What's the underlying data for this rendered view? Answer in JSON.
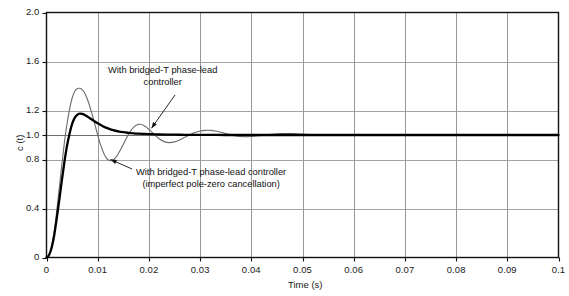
{
  "chart_data": {
    "type": "line",
    "title": "",
    "xlabel": "Time (s)",
    "ylabel": "c (t)",
    "xlim": [
      0,
      0.1
    ],
    "ylim": [
      0,
      2.0
    ],
    "grid": true,
    "legend": "none",
    "xticks": [
      "0",
      "0.01",
      "0.02",
      "0.03",
      "0.04",
      "0.05",
      "0.06",
      "0.07",
      "0.08",
      "0.09",
      "0.1"
    ],
    "xtick_values": [
      0,
      0.01,
      0.02,
      0.03,
      0.04,
      0.05,
      0.06,
      0.07,
      0.08,
      0.09,
      0.1
    ],
    "yticks": [
      "0",
      "0.4",
      "0.8",
      "1.0",
      "1.2",
      "1.6",
      "2.0"
    ],
    "ytick_values": [
      0,
      0.4,
      0.8,
      1.0,
      1.2,
      1.6,
      2.0
    ],
    "annotations": [
      {
        "name": "annotation-phase-lead",
        "lines": [
          "With bridged-T phase-lead",
          "controller"
        ],
        "target_point": [
          0.0205,
          1.055
        ]
      },
      {
        "name": "annotation-imperfect-cancellation",
        "lines": [
          "With bridged-T phase-lead controller",
          "(imperfect pole-zero cancellation)"
        ],
        "target_point": [
          0.0125,
          0.8
        ]
      }
    ],
    "series": [
      {
        "name": "With bridged-T phase-lead controller",
        "color": "#000000",
        "width": 2.3,
        "x": [
          0,
          0.0005,
          0.001,
          0.0015,
          0.002,
          0.0025,
          0.003,
          0.0035,
          0.004,
          0.0045,
          0.005,
          0.0055,
          0.006,
          0.0065,
          0.007,
          0.0075,
          0.008,
          0.009,
          0.01,
          0.011,
          0.012,
          0.013,
          0.014,
          0.015,
          0.016,
          0.017,
          0.018,
          0.019,
          0.02,
          0.022,
          0.024,
          0.026,
          0.028,
          0.03,
          0.035,
          0.04,
          0.05,
          0.06,
          0.07,
          0.08,
          0.09,
          0.1
        ],
        "y": [
          0,
          0.02,
          0.08,
          0.18,
          0.32,
          0.47,
          0.63,
          0.78,
          0.91,
          1.01,
          1.09,
          1.14,
          1.165,
          1.175,
          1.172,
          1.163,
          1.15,
          1.122,
          1.095,
          1.072,
          1.054,
          1.04,
          1.03,
          1.023,
          1.018,
          1.014,
          1.011,
          1.009,
          1.007,
          1.004,
          1.003,
          1.002,
          1.001,
          1.001,
          1.0,
          1.0,
          1.0,
          1.0,
          1.0,
          1.0,
          1.0,
          1.0
        ]
      },
      {
        "name": "With bridged-T phase-lead controller (imperfect pole-zero cancellation)",
        "color": "#6b6b6b",
        "width": 1.1,
        "x": [
          0,
          0.0005,
          0.001,
          0.0015,
          0.002,
          0.0025,
          0.003,
          0.0035,
          0.004,
          0.0045,
          0.005,
          0.0055,
          0.006,
          0.0065,
          0.007,
          0.0075,
          0.008,
          0.0085,
          0.009,
          0.0095,
          0.01,
          0.0105,
          0.011,
          0.0115,
          0.012,
          0.0125,
          0.013,
          0.0135,
          0.014,
          0.0145,
          0.015,
          0.0155,
          0.016,
          0.0165,
          0.017,
          0.0175,
          0.018,
          0.0185,
          0.019,
          0.0195,
          0.02,
          0.021,
          0.022,
          0.023,
          0.024,
          0.025,
          0.026,
          0.027,
          0.028,
          0.029,
          0.03,
          0.031,
          0.032,
          0.033,
          0.034,
          0.035,
          0.036,
          0.037,
          0.038,
          0.039,
          0.04,
          0.042,
          0.044,
          0.046,
          0.048,
          0.05,
          0.055,
          0.06,
          0.07,
          0.08,
          0.09,
          0.1
        ],
        "y": [
          0,
          0.02,
          0.09,
          0.21,
          0.38,
          0.57,
          0.76,
          0.94,
          1.09,
          1.21,
          1.3,
          1.355,
          1.378,
          1.381,
          1.368,
          1.338,
          1.29,
          1.228,
          1.155,
          1.078,
          1.0,
          0.928,
          0.87,
          0.825,
          0.798,
          0.79,
          0.796,
          0.815,
          0.845,
          0.883,
          0.924,
          0.966,
          1.005,
          1.038,
          1.063,
          1.079,
          1.087,
          1.086,
          1.078,
          1.064,
          1.046,
          1.006,
          0.969,
          0.946,
          0.938,
          0.944,
          0.96,
          0.981,
          1.002,
          1.02,
          1.032,
          1.038,
          1.038,
          1.032,
          1.023,
          1.012,
          1.001,
          0.993,
          0.988,
          0.986,
          0.988,
          0.997,
          1.006,
          1.011,
          1.011,
          1.007,
          0.997,
          1.0,
          1.0,
          1.0,
          1.0,
          1.0
        ]
      }
    ]
  }
}
